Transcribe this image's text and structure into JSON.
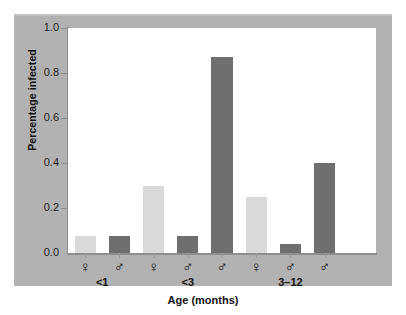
{
  "chart_data": {
    "type": "bar",
    "title": "",
    "xlabel": "Age (months)",
    "ylabel": "Percentage infected",
    "ylim": [
      0.0,
      1.0
    ],
    "yticks": [
      "0.0",
      "0.2",
      "0.4",
      "0.6",
      "0.8",
      "1.0"
    ],
    "ytick_values": [
      0.0,
      0.2,
      0.4,
      0.6,
      0.8,
      1.0
    ],
    "grid": false,
    "legend": "none",
    "groups": [
      {
        "label": "<1",
        "bars": [
          {
            "sex": "♀",
            "sex_name": "female",
            "value": 0.075,
            "shade": "light"
          },
          {
            "sex": "♂",
            "sex_name": "male",
            "value": 0.075,
            "shade": "dark"
          }
        ]
      },
      {
        "label": "<3",
        "bars": [
          {
            "sex": "♀",
            "sex_name": "female",
            "value": 0.3,
            "shade": "light"
          },
          {
            "sex": "♂",
            "sex_name": "male",
            "value": 0.075,
            "shade": "dark"
          },
          {
            "sex": "♂",
            "sex_name": "male",
            "value": 0.87,
            "shade": "dark"
          }
        ]
      },
      {
        "label": "3–12",
        "bars": [
          {
            "sex": "♀",
            "sex_name": "female",
            "value": 0.25,
            "shade": "light"
          },
          {
            "sex": "♂",
            "sex_name": "male",
            "value": 0.04,
            "shade": "dark"
          },
          {
            "sex": "♂",
            "sex_name": "male",
            "value": 0.4,
            "shade": "dark"
          }
        ]
      }
    ],
    "colors": {
      "light_bar": "#d9d9d9",
      "dark_bar": "#6f6f6f",
      "figure_background": "#b2b2b2",
      "plot_background": "#ffffff",
      "axis": "#8e8e8e",
      "text": "#111111"
    }
  }
}
